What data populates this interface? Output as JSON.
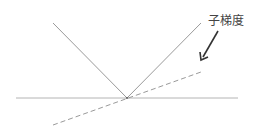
{
  "diagram": {
    "label": "子梯度",
    "colors": {
      "lines": "#9a9a9a",
      "axis": "#b0b0b0",
      "dashed": "#9a9a9a",
      "arrow": "#333333",
      "text": "#444444"
    }
  }
}
